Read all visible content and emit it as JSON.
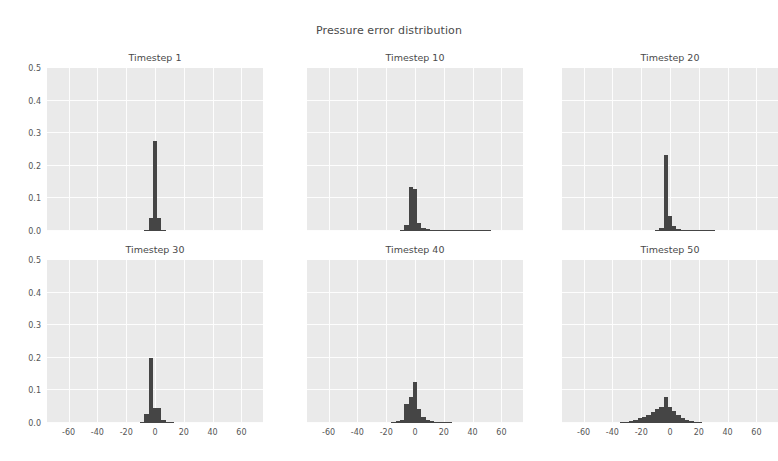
{
  "figure": {
    "title": "Pressure error distribution",
    "background_color": "#ffffff",
    "panel_color": "#eaeaea",
    "grid_color": "#fdfdfd",
    "bar_color": "#454545",
    "text_color": "#4a4a4a"
  },
  "chart_data": {
    "type": "bar",
    "title": "Pressure error distribution",
    "subplot_layout": {
      "rows": 2,
      "cols": 3
    },
    "xlabel": "",
    "ylabel": "",
    "xlim": [
      -75,
      75
    ],
    "ylim": [
      0.0,
      0.5
    ],
    "xticks": [
      -60,
      -40,
      -20,
      0,
      20,
      40,
      60
    ],
    "xtick_labels": [
      "-60",
      "-40",
      "-20",
      "0",
      "20",
      "40",
      "60"
    ],
    "yticks": [
      0.0,
      0.1,
      0.2,
      0.3,
      0.4,
      0.5
    ],
    "ytick_labels": [
      "0.0",
      "0.1",
      "0.2",
      "0.3",
      "0.4",
      "0.5"
    ],
    "grid": true,
    "legend": null,
    "panels": [
      {
        "title": "Timestep 1",
        "row": 0,
        "col": 0,
        "bin_width": 3,
        "bins": [
          -6,
          -3,
          0,
          3,
          6
        ],
        "values": [
          0.004,
          0.041,
          0.275,
          0.04,
          0.004
        ]
      },
      {
        "title": "Timestep 10",
        "row": 0,
        "col": 1,
        "bin_width": 3,
        "bins": [
          -9,
          -6,
          -3,
          0,
          3,
          6,
          9,
          12,
          15,
          18,
          21,
          24,
          27,
          30,
          33,
          36,
          39,
          42,
          45,
          48,
          51
        ],
        "values": [
          0.003,
          0.018,
          0.135,
          0.13,
          0.026,
          0.01,
          0.006,
          0.004,
          0.003,
          0.003,
          0.002,
          0.002,
          0.002,
          0.002,
          0.001,
          0.001,
          0.001,
          0.001,
          0.001,
          0.001,
          0.001
        ]
      },
      {
        "title": "Timestep 20",
        "row": 0,
        "col": 2,
        "bin_width": 3,
        "bins": [
          -9,
          -6,
          -3,
          0,
          3,
          6,
          9,
          12,
          15,
          18,
          21,
          24,
          27,
          30
        ],
        "values": [
          0.003,
          0.01,
          0.232,
          0.045,
          0.015,
          0.006,
          0.004,
          0.003,
          0.002,
          0.002,
          0.002,
          0.001,
          0.001,
          0.001
        ]
      },
      {
        "title": "Timestep 30",
        "row": 1,
        "col": 0,
        "bin_width": 3,
        "bins": [
          -9,
          -6,
          -3,
          0,
          3,
          6,
          9,
          12
        ],
        "values": [
          0.004,
          0.028,
          0.2,
          0.046,
          0.046,
          0.01,
          0.004,
          0.002
        ]
      },
      {
        "title": "Timestep 40",
        "row": 1,
        "col": 1,
        "bin_width": 3,
        "bins": [
          -15,
          -12,
          -9,
          -6,
          -3,
          0,
          3,
          6,
          9,
          12,
          15,
          18,
          21,
          24
        ],
        "values": [
          0.003,
          0.005,
          0.01,
          0.058,
          0.08,
          0.125,
          0.044,
          0.018,
          0.008,
          0.005,
          0.003,
          0.002,
          0.002,
          0.001
        ]
      },
      {
        "title": "Timestep 50",
        "row": 1,
        "col": 2,
        "bin_width": 3,
        "bins": [
          -33,
          -30,
          -27,
          -24,
          -21,
          -18,
          -15,
          -12,
          -9,
          -6,
          -3,
          0,
          3,
          6,
          9,
          12,
          15,
          18,
          21
        ],
        "values": [
          0.002,
          0.004,
          0.006,
          0.01,
          0.014,
          0.018,
          0.026,
          0.034,
          0.042,
          0.048,
          0.08,
          0.05,
          0.038,
          0.026,
          0.016,
          0.01,
          0.006,
          0.004,
          0.002
        ]
      }
    ]
  }
}
